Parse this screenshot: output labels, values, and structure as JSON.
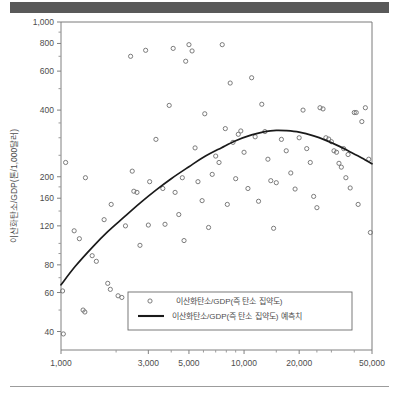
{
  "header": {
    "bar_color": "#595959"
  },
  "footer": {
    "rule_color": "#9c9c9c"
  },
  "chart_data": {
    "type": "scatter",
    "title": "",
    "subtitle": "",
    "xlabel": "1인당 GDP",
    "ylabel": "이산화탄소/GDP(톤/1,000달러)",
    "xscale": "log",
    "yscale": "log",
    "xlim": [
      1000,
      50000
    ],
    "ylim": [
      33,
      1000
    ],
    "grid": false,
    "legend_position": "inside-bottom-center",
    "xticks": [
      1000,
      3000,
      5000,
      10000,
      20000,
      50000
    ],
    "xtick_labels": [
      "1,000",
      "3,000",
      "5,000",
      "10,000",
      "20,000",
      "50,000"
    ],
    "yticks": [
      40,
      60,
      80,
      120,
      160,
      200,
      400,
      600,
      800,
      1000
    ],
    "ytick_labels": [
      "40",
      "60",
      "80",
      "120",
      "160",
      "200",
      "400",
      "600",
      "800",
      "1,000"
    ],
    "yminor_ticks": [
      50,
      70,
      90,
      100,
      140,
      180,
      250,
      300,
      350,
      500,
      700,
      900
    ],
    "legend": [
      {
        "label": "이산화탄소/GDP(즉 탄소 집약도)",
        "marker": "circle-open",
        "color": "#6e6e6e"
      },
      {
        "label": "이산화탄소/GDP(즉 탄소 집약도) 예측치",
        "marker": "line",
        "color": "#1a1a1a"
      }
    ],
    "series": [
      {
        "name": "이산화탄소/GDP(즉 탄소 집약도)",
        "type": "scatter",
        "marker": "circle-open",
        "color": "#6e6e6e",
        "points": [
          [
            1020,
            61
          ],
          [
            1030,
            39
          ],
          [
            1060,
            232
          ],
          [
            1180,
            114
          ],
          [
            1260,
            105
          ],
          [
            1320,
            50
          ],
          [
            1350,
            49
          ],
          [
            1360,
            198
          ],
          [
            1480,
            88
          ],
          [
            1560,
            83
          ],
          [
            1720,
            128
          ],
          [
            1800,
            66
          ],
          [
            1860,
            62
          ],
          [
            1880,
            150
          ],
          [
            2050,
            58
          ],
          [
            2150,
            57
          ],
          [
            2250,
            120
          ],
          [
            2400,
            700
          ],
          [
            2450,
            212
          ],
          [
            2500,
            172
          ],
          [
            2600,
            170
          ],
          [
            2700,
            98
          ],
          [
            2900,
            745
          ],
          [
            3000,
            121
          ],
          [
            3050,
            190
          ],
          [
            3150,
            52
          ],
          [
            3300,
            295
          ],
          [
            3400,
            56
          ],
          [
            3600,
            177
          ],
          [
            3700,
            122
          ],
          [
            3900,
            420
          ],
          [
            4100,
            760
          ],
          [
            4200,
            170
          ],
          [
            4400,
            135
          ],
          [
            4600,
            198
          ],
          [
            4700,
            103
          ],
          [
            4800,
            665
          ],
          [
            5000,
            790
          ],
          [
            5200,
            740
          ],
          [
            5400,
            270
          ],
          [
            5600,
            190
          ],
          [
            5900,
            156
          ],
          [
            6100,
            385
          ],
          [
            6400,
            118
          ],
          [
            6700,
            205
          ],
          [
            7000,
            248
          ],
          [
            7300,
            232
          ],
          [
            7600,
            790
          ],
          [
            7900,
            330
          ],
          [
            8100,
            150
          ],
          [
            8400,
            530
          ],
          [
            8700,
            286
          ],
          [
            9000,
            196
          ],
          [
            9300,
            311
          ],
          [
            9600,
            322
          ],
          [
            10000,
            258
          ],
          [
            10500,
            177
          ],
          [
            11000,
            560
          ],
          [
            11500,
            303
          ],
          [
            12000,
            155
          ],
          [
            12500,
            425
          ],
          [
            13000,
            320
          ],
          [
            13500,
            240
          ],
          [
            14000,
            192
          ],
          [
            14500,
            117
          ],
          [
            15000,
            188
          ],
          [
            16000,
            295
          ],
          [
            17000,
            262
          ],
          [
            18000,
            208
          ],
          [
            19000,
            176
          ],
          [
            20000,
            300
          ],
          [
            21000,
            400
          ],
          [
            22000,
            268
          ],
          [
            23000,
            232
          ],
          [
            24000,
            163
          ],
          [
            25000,
            145
          ],
          [
            26000,
            410
          ],
          [
            27000,
            405
          ],
          [
            28000,
            300
          ],
          [
            29000,
            296
          ],
          [
            30000,
            288
          ],
          [
            31000,
            262
          ],
          [
            32000,
            258
          ],
          [
            33000,
            230
          ],
          [
            34000,
            221
          ],
          [
            35000,
            268
          ],
          [
            36000,
            198
          ],
          [
            37000,
            252
          ],
          [
            38000,
            178
          ],
          [
            40000,
            390
          ],
          [
            41000,
            390
          ],
          [
            42000,
            150
          ],
          [
            44000,
            355
          ],
          [
            46000,
            410
          ],
          [
            48000,
            240
          ],
          [
            49000,
            112
          ]
        ]
      },
      {
        "name": "이산화탄소/GDP(즉 탄소 집약도) 예측치",
        "type": "line",
        "color": "#1a1a1a",
        "points": [
          [
            1000,
            65
          ],
          [
            1200,
            79
          ],
          [
            1500,
            97
          ],
          [
            1800,
            113
          ],
          [
            2200,
            131
          ],
          [
            2700,
            152
          ],
          [
            3300,
            174
          ],
          [
            4000,
            196
          ],
          [
            5000,
            222
          ],
          [
            6000,
            245
          ],
          [
            7500,
            270
          ],
          [
            9000,
            291
          ],
          [
            11000,
            309
          ],
          [
            13000,
            320
          ],
          [
            15000,
            324
          ],
          [
            17000,
            323
          ],
          [
            20000,
            318
          ],
          [
            24000,
            306
          ],
          [
            28000,
            292
          ],
          [
            33000,
            275
          ],
          [
            38000,
            259
          ],
          [
            44000,
            243
          ],
          [
            50000,
            229
          ]
        ]
      }
    ]
  }
}
